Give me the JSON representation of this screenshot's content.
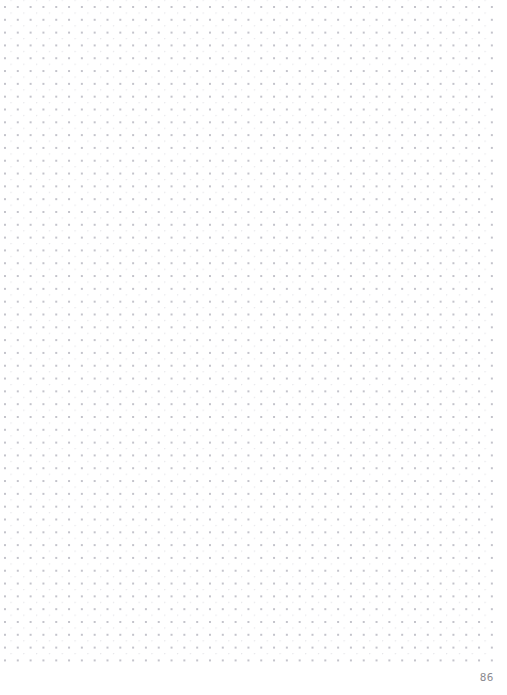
{
  "page": {
    "width": 507,
    "height": 695,
    "background_color": "#ffffff",
    "type": "dot-grid-notebook-page"
  },
  "grid": {
    "dot_color": "#b9b9c2",
    "spacing_px": 12.82,
    "dot_radius_px": 0.9,
    "origin_x_px": 4,
    "origin_y_px": 6,
    "columns": 39,
    "rows": 52,
    "right_margin_px": 12,
    "bottom_margin_px": 32
  },
  "footer": {
    "page_number": "86",
    "color": "#8a8a90"
  }
}
